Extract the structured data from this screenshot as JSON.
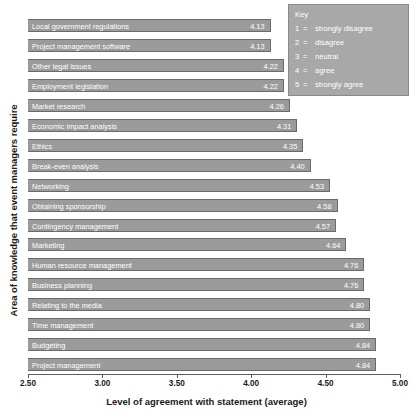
{
  "chart_data": {
    "type": "bar",
    "orientation": "horizontal",
    "title": "",
    "xlabel": "Level of agreement with statement (average)",
    "ylabel": "Area of knowledge that event managers require",
    "xlim": [
      2.5,
      5.0
    ],
    "xticks": [
      "2.50",
      "3.00",
      "3.50",
      "4.00",
      "4.50",
      "5.00"
    ],
    "xtick_values": [
      2.5,
      3.0,
      3.5,
      4.0,
      4.5,
      5.0
    ],
    "grid": false,
    "legend_position": "top-right",
    "categories": [
      "Local government regulations",
      "Project management software",
      "Other legal issues",
      "Employment legislation",
      "Market research",
      "Economic impact analysis",
      "Ethics",
      "Break-even analysis",
      "Networking",
      "Obtaining sponsorship",
      "Contingency management",
      "Marketing",
      "Human resource management",
      "Business planning",
      "Relating to the media",
      "Time management",
      "Budgeting",
      "Project management"
    ],
    "values": [
      4.13,
      4.13,
      4.22,
      4.22,
      4.26,
      4.31,
      4.35,
      4.4,
      4.53,
      4.58,
      4.57,
      4.64,
      4.76,
      4.76,
      4.8,
      4.8,
      4.84,
      4.84
    ],
    "value_labels": [
      "4.13",
      "4.13",
      "4.22",
      "4.22",
      "4.26",
      "4.31",
      "4.35",
      "4.40",
      "4.53",
      "4.58",
      "4.57",
      "4.64",
      "4.76",
      "4.76",
      "4.80",
      "4.80",
      "4.84",
      "4.84"
    ],
    "bar_color": "#9b9b9b",
    "bar_border_color": "#6a6a6a",
    "label_color": "#ffffff"
  },
  "key": {
    "title": "Key",
    "items": [
      {
        "number": "1",
        "equals": "=",
        "label": "strongly disagree"
      },
      {
        "number": "2",
        "equals": "=",
        "label": "disagree"
      },
      {
        "number": "3",
        "equals": "=",
        "label": "neutral"
      },
      {
        "number": "4",
        "equals": "=",
        "label": "agree"
      },
      {
        "number": "5",
        "equals": "=",
        "label": "strongly agree"
      }
    ],
    "background": "#a8a8a8"
  }
}
